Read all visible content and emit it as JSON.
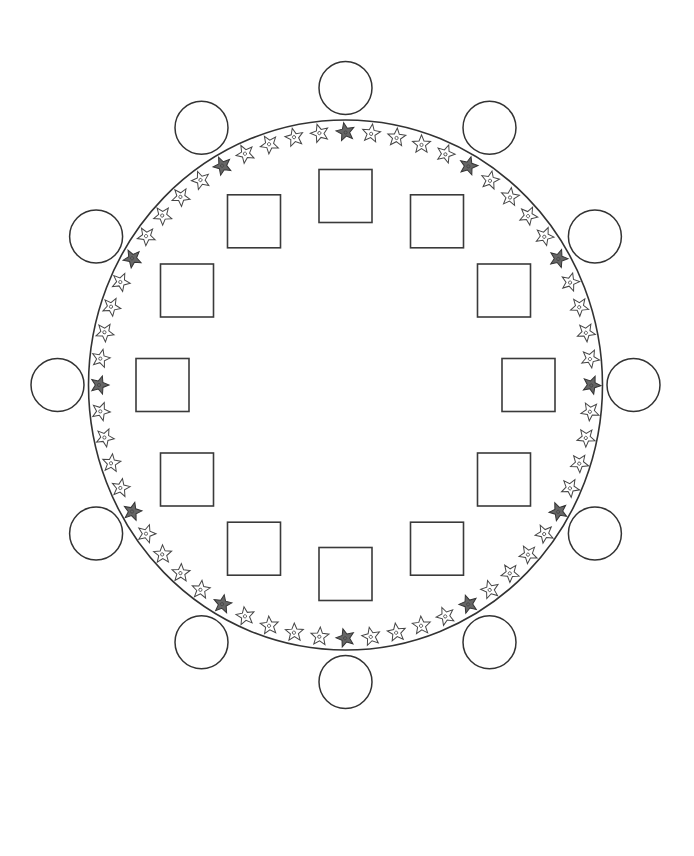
{
  "diagram": {
    "type": "circular-seating-layout",
    "canvas": {
      "width": 694,
      "height": 856,
      "background": "#ffffff"
    },
    "center": {
      "x": 345.5,
      "y": 385
    },
    "outer_ring": {
      "rx": 257,
      "ry": 265,
      "stroke": "#333333"
    },
    "outer_circles": {
      "count": 12,
      "radius": 26.5,
      "orbit_rx": 288,
      "orbit_ry": 297,
      "start_angle_deg": -90,
      "stroke": "#333333"
    },
    "inner_squares": {
      "count": 12,
      "size": 53,
      "orbit_rx": 183,
      "orbit_ry": 189,
      "start_angle_deg": -90,
      "stroke": "#3a3a3a"
    },
    "star_border": {
      "count": 60,
      "orbit_rx": 246,
      "orbit_ry": 253,
      "start_angle_deg": -90,
      "dark_every": 5,
      "star_outer_radius": 9.5,
      "star_inner_radius": 4.2,
      "light_fill": "#ffffff",
      "dark_fill": "#666666",
      "stroke": "#444444"
    }
  }
}
